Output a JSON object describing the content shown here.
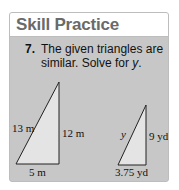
{
  "card": {
    "title": "Skill Practice",
    "colors": {
      "header_bg": "#ffffff",
      "title_text": "#6a6a6a",
      "body_bg": "#c7c7c7",
      "border": "#bdbdbd",
      "triangle_fill": "#e4e4e4"
    }
  },
  "problem": {
    "number": "7.",
    "text_part1": "The given triangles are similar. Solve for ",
    "variable": "y",
    "text_part2": "."
  },
  "figure": {
    "triangle_large": {
      "hypotenuse_label": "13 m",
      "vertical_label": "12 m",
      "base_label": "5 m"
    },
    "triangle_small": {
      "hypotenuse_label": "y",
      "vertical_label": "9 yd",
      "base_label": "3.75 yd"
    }
  }
}
